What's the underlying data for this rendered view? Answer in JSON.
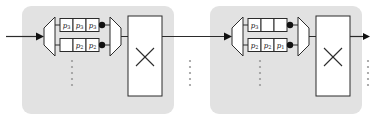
{
  "diagram": {
    "colors": {
      "panel_fill": "#e2e2e2",
      "stroke": "#2b2b2b",
      "cell_fill": "#ffffff",
      "node_dot": "#111111",
      "ellipsis": "#9a9a9a"
    },
    "stages": [
      {
        "name": "stage-left",
        "demux_label": "",
        "mux_label": "",
        "rows": [
          {
            "name": "row-top",
            "cells": [
              {
                "base": "p",
                "sub": "3"
              },
              {
                "base": "p",
                "sub": "3"
              },
              {
                "base": "p",
                "sub": "3"
              }
            ]
          },
          {
            "name": "row-bottom",
            "cells": [
              {
                "base": "",
                "sub": ""
              },
              {
                "base": "p",
                "sub": "2"
              },
              {
                "base": "p",
                "sub": "2"
              }
            ]
          }
        ],
        "block_label": "x-crossed-block"
      },
      {
        "name": "stage-right",
        "demux_label": "",
        "mux_label": "",
        "rows": [
          {
            "name": "row-top",
            "cells": [
              {
                "base": "p",
                "sub": "3"
              },
              {
                "base": "",
                "sub": ""
              },
              {
                "base": "",
                "sub": ""
              }
            ]
          },
          {
            "name": "row-bottom",
            "cells": [
              {
                "base": "p",
                "sub": "2"
              },
              {
                "base": "p",
                "sub": "2"
              },
              {
                "base": "p",
                "sub": "1"
              }
            ]
          }
        ],
        "block_label": "x-crossed-block"
      }
    ],
    "ellipses": [
      {
        "name": "ellipsis-left-rows"
      },
      {
        "name": "ellipsis-between-stages"
      },
      {
        "name": "ellipsis-right-rows"
      },
      {
        "name": "ellipsis-after-output"
      }
    ],
    "wires": [
      {
        "name": "input-arrow"
      },
      {
        "name": "interstage-arrow"
      },
      {
        "name": "output-arrow"
      }
    ]
  }
}
